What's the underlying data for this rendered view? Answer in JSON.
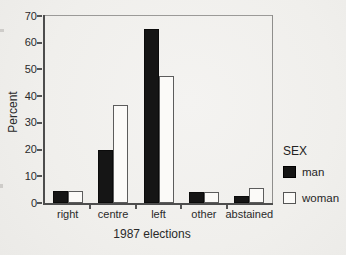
{
  "chart_data": {
    "type": "bar",
    "title": "",
    "categories": [
      "right",
      "centre",
      "left",
      "other",
      "abstained"
    ],
    "series": [
      {
        "name": "man",
        "color": "#151515",
        "values": [
          4.5,
          20,
          65,
          4,
          2.5
        ]
      },
      {
        "name": "woman",
        "color": "#fbfaf8",
        "values": [
          4.5,
          36.5,
          47.5,
          4,
          5.5
        ]
      }
    ],
    "xlabel": "1987 elections",
    "ylabel": "Percent",
    "ylim": [
      0,
      70
    ],
    "yticks": [
      0,
      10,
      20,
      30,
      40,
      50,
      60,
      70
    ],
    "legend_title": "SEX",
    "legend_position": "right",
    "grid": false
  },
  "colors": {
    "paper": "#f1efec",
    "axis": "#4d4d4d",
    "frame": "#9b9a98",
    "man_fill": "#151515",
    "woman_fill": "#fbfaf8",
    "woman_border": "#5c5c5c",
    "text": "#262626"
  }
}
